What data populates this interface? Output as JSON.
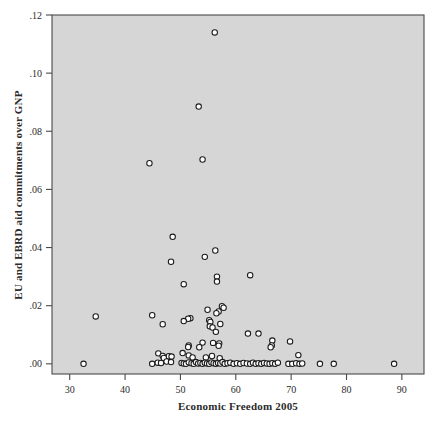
{
  "figure": {
    "name": "scatter-plot-figure",
    "background_color": "#ffffff",
    "plot_area_color": "#d6d6d6",
    "frame_color": "#4a4a4a",
    "marker_fill": "#ffffff",
    "marker_stroke": "#1a1a1a"
  },
  "chart_data": {
    "type": "scatter",
    "title": "",
    "xlabel": "Economic Freedom 2005",
    "ylabel": "EU and EBRD aid commitments over GNP",
    "xlim": [
      26.8,
      94.0
    ],
    "ylim": [
      -0.0035,
      0.12
    ],
    "xticks": [
      30,
      40,
      50,
      60,
      70,
      80,
      90
    ],
    "xticklabels": [
      "30",
      "40",
      "50",
      "60",
      "70",
      "80",
      "90"
    ],
    "yticks": [
      0.0,
      0.02,
      0.04,
      0.06,
      0.08,
      0.1,
      0.12
    ],
    "yticklabels": [
      ".00",
      ".02",
      ".04",
      ".06",
      ".08",
      ".10",
      ".12"
    ],
    "grid": false,
    "legend": null,
    "marker": "open-circle",
    "points": [
      [
        56.2,
        0.114
      ],
      [
        53.3,
        0.0885
      ],
      [
        44.4,
        0.069
      ],
      [
        54.0,
        0.0703
      ],
      [
        48.6,
        0.0437
      ],
      [
        56.3,
        0.039
      ],
      [
        54.4,
        0.0368
      ],
      [
        48.3,
        0.0351
      ],
      [
        62.6,
        0.0305
      ],
      [
        56.6,
        0.03
      ],
      [
        56.6,
        0.0283
      ],
      [
        50.6,
        0.0274
      ],
      [
        57.5,
        0.0198
      ],
      [
        57.8,
        0.0193
      ],
      [
        54.9,
        0.0186
      ],
      [
        56.9,
        0.018
      ],
      [
        56.5,
        0.0174
      ],
      [
        44.9,
        0.0167
      ],
      [
        34.7,
        0.0163
      ],
      [
        51.8,
        0.0157
      ],
      [
        51.4,
        0.0155
      ],
      [
        55.2,
        0.015
      ],
      [
        55.4,
        0.0144
      ],
      [
        57.2,
        0.0137
      ],
      [
        50.6,
        0.0147
      ],
      [
        46.8,
        0.0136
      ],
      [
        55.3,
        0.0129
      ],
      [
        55.8,
        0.0125
      ],
      [
        62.2,
        0.0104
      ],
      [
        64.1,
        0.0104
      ],
      [
        56.4,
        0.011
      ],
      [
        54.0,
        0.0073
      ],
      [
        55.9,
        0.0072
      ],
      [
        57.0,
        0.007
      ],
      [
        56.9,
        0.0062
      ],
      [
        51.5,
        0.0063
      ],
      [
        51.4,
        0.0058
      ],
      [
        53.4,
        0.0057
      ],
      [
        50.4,
        0.0037
      ],
      [
        46.0,
        0.0036
      ],
      [
        46.8,
        0.0027
      ],
      [
        47.9,
        0.0026
      ],
      [
        47.0,
        0.002
      ],
      [
        48.4,
        0.0025
      ],
      [
        51.5,
        0.0029
      ],
      [
        52.2,
        0.0022
      ],
      [
        54.6,
        0.0022
      ],
      [
        55.7,
        0.0027
      ],
      [
        57.1,
        0.0019
      ],
      [
        66.6,
        0.008
      ],
      [
        66.5,
        0.0063
      ],
      [
        66.3,
        0.0057
      ],
      [
        69.8,
        0.0077
      ],
      [
        71.3,
        0.003
      ],
      [
        32.5,
        0.0
      ],
      [
        44.9,
        0.0
      ],
      [
        45.9,
        0.0004
      ],
      [
        46.5,
        0.0003
      ],
      [
        47.5,
        0.0008
      ],
      [
        48.3,
        0.0006
      ],
      [
        50.2,
        0.0003
      ],
      [
        50.6,
        0.0001
      ],
      [
        51.0,
        0.0
      ],
      [
        51.5,
        0.0005
      ],
      [
        52.0,
        0.0002
      ],
      [
        52.4,
        0.0
      ],
      [
        52.8,
        0.0006
      ],
      [
        53.2,
        0.0001
      ],
      [
        53.6,
        0.0003
      ],
      [
        54.0,
        0.0
      ],
      [
        54.4,
        0.0004
      ],
      [
        54.8,
        0.0001
      ],
      [
        55.2,
        0.0
      ],
      [
        55.6,
        0.0005
      ],
      [
        56.0,
        0.0002
      ],
      [
        56.4,
        0.0
      ],
      [
        56.8,
        0.0003
      ],
      [
        57.2,
        0.0001
      ],
      [
        57.6,
        0.0006
      ],
      [
        58.0,
        0.0
      ],
      [
        58.5,
        0.0002
      ],
      [
        59.0,
        0.0004
      ],
      [
        59.6,
        0.0
      ],
      [
        60.2,
        0.0002
      ],
      [
        60.8,
        0.0
      ],
      [
        61.4,
        0.0003
      ],
      [
        62.0,
        0.0001
      ],
      [
        62.6,
        0.0
      ],
      [
        63.1,
        0.0004
      ],
      [
        63.6,
        0.0
      ],
      [
        64.1,
        0.0002
      ],
      [
        64.6,
        0.0
      ],
      [
        65.1,
        0.0003
      ],
      [
        65.6,
        0.0001
      ],
      [
        66.1,
        0.0
      ],
      [
        66.6,
        0.0002
      ],
      [
        67.1,
        0.0
      ],
      [
        67.6,
        0.0004
      ],
      [
        69.5,
        0.0
      ],
      [
        70.2,
        0.0
      ],
      [
        70.9,
        0.0002
      ],
      [
        71.5,
        0.0
      ],
      [
        72.0,
        0.0001
      ],
      [
        75.2,
        0.0
      ],
      [
        77.7,
        0.0
      ],
      [
        88.6,
        0.0
      ]
    ]
  }
}
